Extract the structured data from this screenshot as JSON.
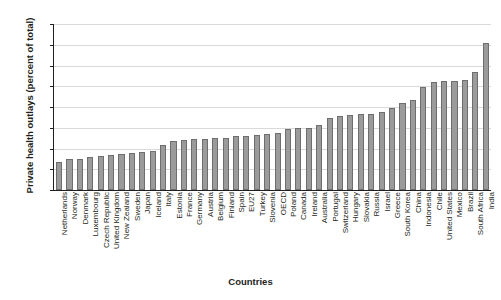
{
  "chart_data": {
    "type": "bar",
    "title": "",
    "xlabel": "Countries",
    "ylabel": "Private health outlays (percent of total)",
    "ylim": [
      0,
      80
    ],
    "yticks": [
      0,
      10,
      20,
      30,
      40,
      50,
      60,
      70,
      80
    ],
    "grid": true,
    "legend": "none",
    "bar_color": "#9b9b9b",
    "bar_edge_color": "#6e6e6e",
    "categories": [
      "Netherlands",
      "Norway",
      "Denmark",
      "Luxembourg",
      "Czech Republic",
      "United Kingdom",
      "New Zealand",
      "Sweden",
      "Japan",
      "Iceland",
      "Italy",
      "Estonia",
      "France",
      "Germany",
      "Austria",
      "Belgium",
      "Finland",
      "Spain",
      "EU27",
      "Turkey",
      "Slovenia",
      "OECD",
      "Poland",
      "Canada",
      "Ireland",
      "Australia",
      "Portugal",
      "Switzerland",
      "Hungary",
      "Slovakia",
      "Russia",
      "Israel",
      "Greece",
      "South Korea",
      "China",
      "Indonesia",
      "Chile",
      "United States",
      "Mexico",
      "Brazil",
      "South Africa",
      "India"
    ],
    "values": [
      13.5,
      15.0,
      15.0,
      16.0,
      16.5,
      17.0,
      17.5,
      18.0,
      18.5,
      19.0,
      21.5,
      23.5,
      24.0,
      24.5,
      24.5,
      25.0,
      25.0,
      26.0,
      26.0,
      26.5,
      27.0,
      27.5,
      29.5,
      30.0,
      30.0,
      31.5,
      34.5,
      35.5,
      36.0,
      36.5,
      36.5,
      37.5,
      39.5,
      42.0,
      43.5,
      49.5,
      52.0,
      52.5,
      52.5,
      53.0,
      57.0,
      71.0
    ]
  }
}
